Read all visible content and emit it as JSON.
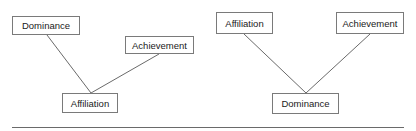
{
  "diagrams": [
    {
      "name": "left",
      "nodes": [
        {
          "id": "dominance",
          "label": "Dominance",
          "x": 12,
          "y": 16,
          "w": 68,
          "h": 19
        },
        {
          "id": "achievement",
          "label": "Achievement",
          "x": 125,
          "y": 36,
          "w": 69,
          "h": 18
        },
        {
          "id": "affiliation",
          "label": "Affiliation",
          "x": 62,
          "y": 93,
          "w": 56,
          "h": 20
        }
      ],
      "edges": [
        {
          "from": [
            47,
            35
          ],
          "to": [
            91,
            93
          ]
        },
        {
          "from": [
            159,
            54
          ],
          "to": [
            91,
            93
          ]
        }
      ]
    },
    {
      "name": "right",
      "nodes": [
        {
          "id": "affiliation",
          "label": "Affiliation",
          "x": 216,
          "y": 12,
          "w": 57,
          "h": 22
        },
        {
          "id": "achievement",
          "label": "Achievement",
          "x": 336,
          "y": 12,
          "w": 68,
          "h": 22
        },
        {
          "id": "dominance",
          "label": "Dominance",
          "x": 272,
          "y": 93,
          "w": 67,
          "h": 21
        }
      ],
      "edges": [
        {
          "from": [
            244,
            34
          ],
          "to": [
            306,
            93
          ]
        },
        {
          "from": [
            370,
            34
          ],
          "to": [
            306,
            93
          ]
        }
      ]
    }
  ],
  "colors": {
    "border": "#7a7a7a",
    "line": "#6a6a6a",
    "text": "#1a1a1a"
  }
}
